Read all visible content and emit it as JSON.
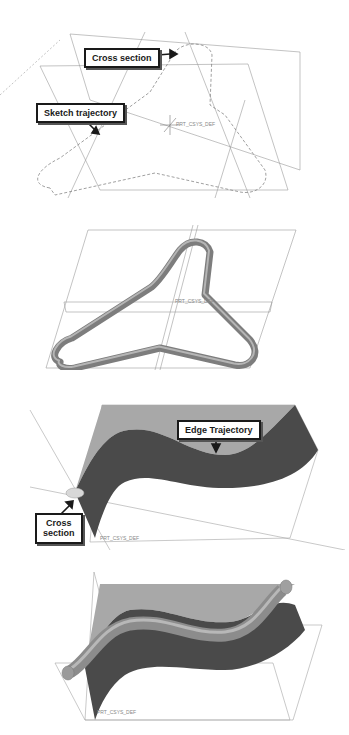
{
  "figure": {
    "panels": [
      {
        "id": "sketch-trajectory-panel",
        "callouts": [
          {
            "label": "Cross section"
          },
          {
            "label": "Sketch trajectory"
          }
        ],
        "csys_label": "PRT_CSYS_DEF"
      },
      {
        "id": "swept-tube-panel",
        "csys_label": "PRT_CSYS_DEF"
      },
      {
        "id": "edge-trajectory-panel",
        "callouts": [
          {
            "label": "Edge Trajectory"
          },
          {
            "label_line1": "Cross",
            "label_line2": "section"
          }
        ],
        "csys_label": "PRT_CSYS_DEF"
      },
      {
        "id": "swept-along-edge-panel",
        "csys_label": "PRT_CSYS_DEF"
      }
    ],
    "colors": {
      "datum_line": "#9a9a9a",
      "surface_light": "#a8a8a8",
      "surface_dark": "#4a4a4a",
      "tube": "#8c8c8c",
      "callout_border": "#1a1a1a"
    }
  }
}
